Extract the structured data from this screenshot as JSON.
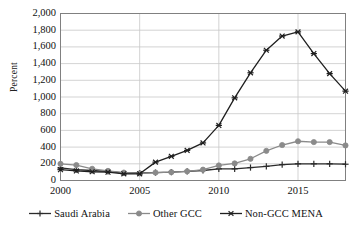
{
  "chart_data": {
    "type": "line",
    "title": "",
    "xlabel": "",
    "ylabel": "Percent",
    "x": [
      2000,
      2001,
      2002,
      2003,
      2004,
      2005,
      2006,
      2007,
      2008,
      2009,
      2010,
      2011,
      2012,
      2013,
      2014,
      2015,
      2016,
      2017,
      2018
    ],
    "xlim": [
      2000,
      2018
    ],
    "ylim": [
      0,
      2000
    ],
    "grid": "horizontal-and-major-vertical",
    "legend_position": "bottom",
    "y_ticks": [
      "0",
      "200",
      "400",
      "600",
      "800",
      "1,000",
      "1,200",
      "1,400",
      "1,600",
      "1,800",
      "2,000"
    ],
    "y_tick_values": [
      0,
      200,
      400,
      600,
      800,
      1000,
      1200,
      1400,
      1600,
      1800,
      2000
    ],
    "x_ticks": [
      "2000",
      "2005",
      "2010",
      "2015"
    ],
    "x_tick_values": [
      2000,
      2005,
      2010,
      2015
    ],
    "series": [
      {
        "name": "Saudi Arabia",
        "marker": "plus",
        "color": "#2b2b2b",
        "values": [
          150,
          130,
          120,
          110,
          90,
          90,
          95,
          100,
          110,
          120,
          140,
          140,
          155,
          170,
          190,
          200,
          200,
          200,
          195
        ]
      },
      {
        "name": "Other GCC",
        "marker": "circle",
        "color": "#8a8a8a",
        "values": [
          200,
          185,
          140,
          115,
          95,
          85,
          95,
          100,
          110,
          130,
          180,
          205,
          260,
          355,
          425,
          470,
          460,
          460,
          420
        ]
      },
      {
        "name": "Non-GCC MENA",
        "marker": "asterisk",
        "color": "#1f1f1f",
        "values": [
          130,
          115,
          105,
          100,
          80,
          80,
          220,
          290,
          360,
          450,
          660,
          990,
          1290,
          1560,
          1730,
          1780,
          1520,
          1280,
          1070
        ]
      }
    ]
  },
  "colors": {
    "grid": "#c8c8c8",
    "axis": "#808080",
    "plot_background": "#ffffff",
    "text": "#111111"
  }
}
